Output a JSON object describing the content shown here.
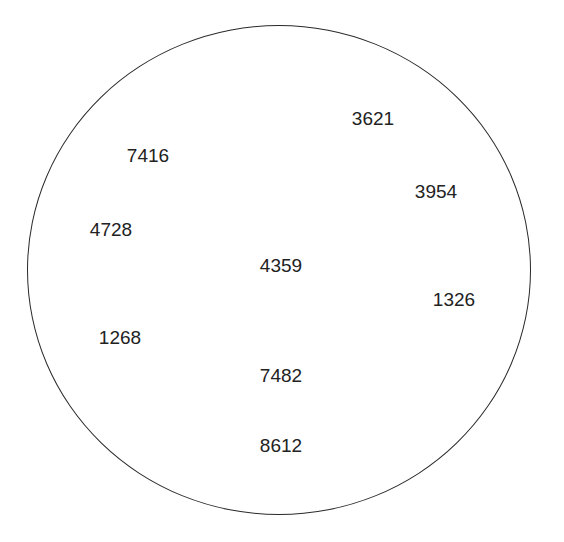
{
  "diagram": {
    "shape": "circle",
    "stroke_color": "#2a2a2a",
    "labels": [
      {
        "text": "3621",
        "x": 373,
        "y": 118
      },
      {
        "text": "7416",
        "x": 148,
        "y": 155
      },
      {
        "text": "3954",
        "x": 436,
        "y": 191
      },
      {
        "text": "4728",
        "x": 111,
        "y": 229
      },
      {
        "text": "4359",
        "x": 281,
        "y": 265
      },
      {
        "text": "1326",
        "x": 454,
        "y": 299
      },
      {
        "text": "1268",
        "x": 120,
        "y": 337
      },
      {
        "text": "7482",
        "x": 281,
        "y": 375
      },
      {
        "text": "8612",
        "x": 281,
        "y": 445
      }
    ]
  }
}
